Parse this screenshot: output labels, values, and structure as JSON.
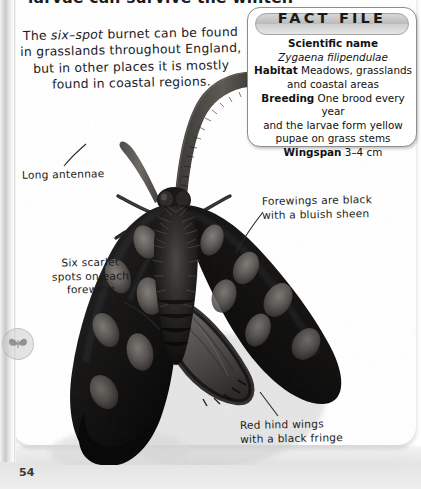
{
  "page": {
    "number": "54",
    "cut_off_heading": "larvae can survive the winter.",
    "intro_text_part1": "The ",
    "intro_text_italic": "six–spot",
    "intro_text_part2": " burnet can be found in grasslands throughout England, but in other places it is mostly found in coastal regions."
  },
  "fact_file": {
    "title": "FACT FILE",
    "rows": [
      {
        "label": "Scientific name",
        "value": ""
      },
      {
        "label": "",
        "value": "Zygaena filipendulae"
      },
      {
        "label": "Habitat",
        "value": "Meadows, grasslands and coastal areas"
      },
      {
        "label": "Breeding",
        "value": "One brood every year and the larvae form yellow pupae on grass stems"
      },
      {
        "label": "Wingspan",
        "value": "3–4 cm"
      }
    ],
    "scientific_name_heading": "Scientific name",
    "scientific_name_value": "Zygaena filipendulae",
    "habitat_label": "Habitat",
    "habitat_value": "Meadows, grasslands",
    "habitat_value_line2": "and coastal areas",
    "breeding_label": "Breeding",
    "breeding_value": "One brood every year",
    "breeding_value_line2": "and the larvae form yellow",
    "breeding_value_line3": "pupae on grass stems",
    "wingspan_label": "Wingspan",
    "wingspan_value": "3–4 cm"
  },
  "annotations": [
    {
      "name": "long-antennae",
      "text": "Long antennae"
    },
    {
      "name": "six-scarlet-spots",
      "text": "Six scarlet\nspots on each\nforewing"
    },
    {
      "name": "forewings-black",
      "text": "Forewings are black\nwith a bluish sheen"
    },
    {
      "name": "red-hind-wings",
      "text": "Red hind wings\nwith a black fringe"
    }
  ],
  "annotation_antennae": "Long antennae",
  "annotation_spots": "Six scarlet\nspots on each\nforewing",
  "annotation_forewings": "Forewings are black\nwith a bluish sheen",
  "annotation_hindwings": "Red hind wings\nwith a black fringe",
  "photo": {
    "subject": "six-spot burnet moth",
    "alt": "Close-up photograph of a six-spot burnet moth with dark forewings bearing pale oval spots"
  },
  "colors": {
    "page_background": "#ffffff",
    "text": "#1b1b1b",
    "factfile_border": "#8d8d8d",
    "banner_gray": "#bcbcbc",
    "moth_dark": "#151515",
    "moth_spot": "#6e6e6e"
  }
}
